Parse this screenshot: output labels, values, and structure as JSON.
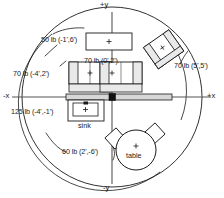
{
  "diagram": {
    "colors": {
      "line": "#1a1a1a",
      "fill_light": "#e9e9e9",
      "fill_white": "#ffffff",
      "beam": "#d7d7d7"
    },
    "axes": {
      "plus_y": "+y",
      "minus_y": "-y",
      "plus_x": "+x",
      "minus_x": "-x"
    },
    "loads": [
      {
        "id": "load-50",
        "text": "50 lb (-1',6')",
        "weight": "50 lb",
        "coords": "(-1',6')"
      },
      {
        "id": "load-70-center",
        "text": "70 lb (0',2')",
        "weight": "70 lb",
        "coords": "(0',2')"
      },
      {
        "id": "load-70-left",
        "text": "70 lb (-4',2')",
        "weight": "70 lb",
        "coords": "(-4',2')"
      },
      {
        "id": "load-70-right",
        "text": "70 lb (5',5')",
        "weight": "70 lb",
        "coords": "(5',5')"
      },
      {
        "id": "load-125",
        "text": "125 lb (-4',-1')",
        "weight": "125 lb",
        "coords": "(-4',-1')"
      },
      {
        "id": "load-60",
        "text": "60 lb (2',-6')",
        "weight": "60 lb",
        "coords": "(2',-6')"
      }
    ],
    "objects": [
      {
        "id": "obj-sink",
        "label": "sink"
      },
      {
        "id": "obj-table",
        "label": "table"
      }
    ]
  }
}
